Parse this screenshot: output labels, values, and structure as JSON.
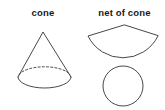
{
  "canvas": {
    "width": 165,
    "height": 110,
    "background_color": "#ffffff",
    "stroke_color": "#333333",
    "text_color": "#1a1a1a"
  },
  "figures": {
    "left": {
      "label": "cone",
      "shape_name": "cone-3d",
      "parts": [
        {
          "name": "cone-lateral-triangle",
          "description": "apex with two slant lines to base ellipse",
          "apex": [
            43,
            32
          ],
          "left_base": [
            18,
            77
          ],
          "right_base": [
            71,
            77
          ]
        },
        {
          "name": "cone-base-ellipse-front",
          "style": "solid",
          "center": [
            44.5,
            77
          ],
          "rx": 26.5,
          "ry": 11
        },
        {
          "name": "cone-base-ellipse-back",
          "style": "dashed",
          "center": [
            44.5,
            77
          ],
          "rx": 26.5,
          "ry": 11
        }
      ]
    },
    "right": {
      "label": "net of cone",
      "shape_name": "net-of-cone",
      "parts": [
        {
          "name": "net-sector",
          "description": "circular sector forming the lateral surface",
          "apex": [
            124,
            25
          ],
          "left_corner": [
            88,
            36
          ],
          "right_corner": [
            158,
            36
          ],
          "arc_lowest_point": [
            124,
            66
          ]
        },
        {
          "name": "net-base-circle",
          "description": "circle forming the base",
          "center": [
            123,
            86
          ],
          "r": 20
        }
      ]
    }
  }
}
